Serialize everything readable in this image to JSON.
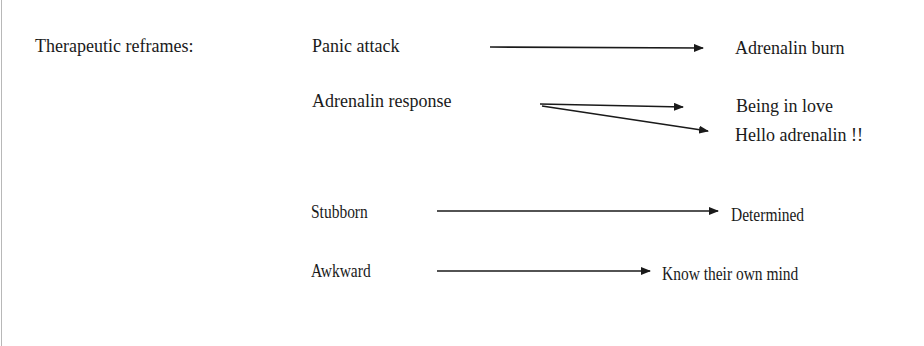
{
  "heading": "Therapeutic reframes:",
  "reframes": [
    {
      "from": "Panic attack",
      "to": [
        "Adrenalin burn"
      ]
    },
    {
      "from": "Adrenalin response",
      "to": [
        "Being in love",
        "Hello adrenalin !!"
      ]
    },
    {
      "from": "Stubborn",
      "to": [
        "Determined"
      ]
    },
    {
      "from": "Awkward",
      "to": [
        "Know their own mind"
      ]
    }
  ],
  "colors": {
    "text": "#1a1a1a",
    "arrow": "#1a1a1a",
    "border": "#b8b8b8"
  }
}
